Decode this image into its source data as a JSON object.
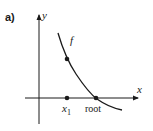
{
  "figure": {
    "panel_label": "a)",
    "y_axis_label": "y",
    "x_axis_label": "x",
    "curve_label": "f",
    "points": [
      {
        "name": "x1",
        "label_base": "x",
        "label_sub": "1",
        "on_axis": true
      },
      {
        "name": "f-of-x1",
        "on_axis": false
      },
      {
        "name": "root",
        "label": "root",
        "on_axis": true
      }
    ]
  },
  "colors": {
    "ink": "#1a1a1a",
    "background": "#ffffff"
  }
}
